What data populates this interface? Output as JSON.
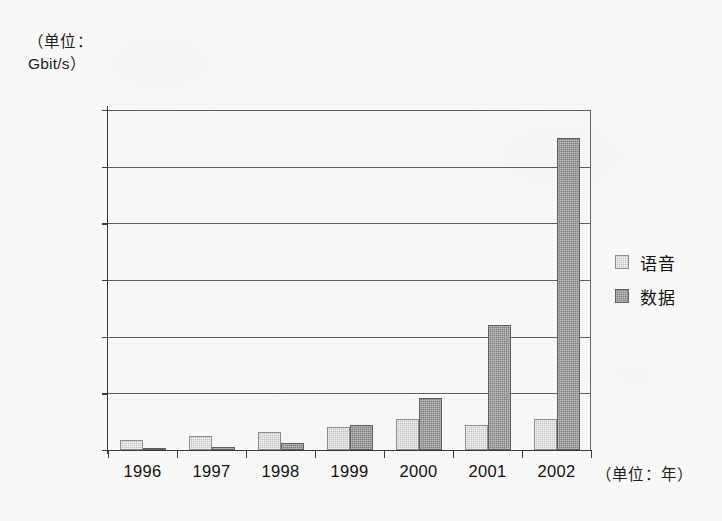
{
  "chart_data": {
    "type": "bar",
    "title": "",
    "categories": [
      "1996",
      "1997",
      "1998",
      "1999",
      "2000",
      "2001",
      "2002"
    ],
    "series": [
      {
        "name": "语音",
        "color": "#c2c2c2",
        "values": [
          900,
          1200,
          1600,
          2000,
          2700,
          2200,
          2700
        ]
      },
      {
        "name": "数据",
        "color": "#7f7f7f",
        "values": [
          150,
          250,
          600,
          2200,
          4600,
          11000,
          27500
        ]
      }
    ],
    "xlabel": "（单位：年）",
    "ylabel": "（单位：\nGbit/s）",
    "ylim": [
      0,
      30000
    ],
    "ytick_values": [
      0,
      5000,
      10000,
      15000,
      20000,
      25000,
      30000
    ],
    "ytick_labels": [
      "0",
      "5 000",
      "10 000",
      "15 000",
      "20 000",
      "25 000",
      "30 000"
    ],
    "grid": true,
    "legend_position": "right"
  },
  "annotations": {
    "unit_caption_line1": "（单位：",
    "unit_caption_line2": "Gbit/s）",
    "x_axis_unit": "（单位：年）"
  },
  "legend": {
    "items": [
      {
        "label": "语音",
        "color": "#c2c2c2"
      },
      {
        "label": "数据",
        "color": "#7f7f7f"
      }
    ]
  }
}
